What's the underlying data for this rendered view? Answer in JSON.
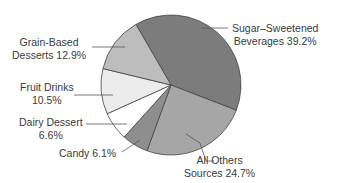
{
  "chart_data": {
    "type": "pie",
    "title": "",
    "categories": [
      "Sugar–Sweetened Beverages",
      "All Others Sources",
      "Candy",
      "Dairy Dessert",
      "Fruit Drinks",
      "Grain-Based Desserts"
    ],
    "values": [
      39.2,
      24.7,
      6.1,
      6.6,
      10.5,
      12.9
    ],
    "unit": "%",
    "colors": [
      "#7c7c7c",
      "#a6a6a6",
      "#8e8e8e",
      "#ffffff",
      "#ececec",
      "#bdbdbd"
    ],
    "start_angle_deg_clockwise_from_top": -30,
    "legend": "none (direct labels with leader lines)"
  },
  "labels": {
    "sugar": {
      "line1": "Sugar–Sweetened",
      "line2": "Beverages 39.2%"
    },
    "others": {
      "line1": "All Others",
      "line2": "Sources 24.7%"
    },
    "candy": {
      "line1": "Candy 6.1%"
    },
    "dairy": {
      "line1": "Dairy Dessert",
      "line2": "6.6%"
    },
    "fruit": {
      "line1": "Fruit Drinks",
      "line2": "10.5%"
    },
    "grain": {
      "line1": "Grain-Based",
      "line2": "Desserts 12.9%"
    }
  }
}
